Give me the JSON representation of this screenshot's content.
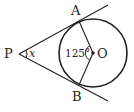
{
  "diagram": {
    "type": "geometry",
    "points": {
      "P": {
        "label": "P",
        "x": 19,
        "y": 54
      },
      "A": {
        "label": "A",
        "x": 79,
        "y": 20
      },
      "B": {
        "label": "B",
        "x": 79,
        "y": 86
      },
      "O": {
        "label": "O",
        "x": 93,
        "y": 53
      }
    },
    "circle": {
      "center": "O",
      "radius": 34
    },
    "angles": {
      "AOB": {
        "label": "125°",
        "value": 125
      },
      "APB": {
        "label": "x"
      }
    },
    "colors": {
      "stroke": "#222222",
      "background": "#ffffff"
    }
  }
}
